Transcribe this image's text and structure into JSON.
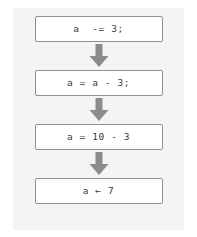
{
  "diagram": {
    "orientation": "vertical",
    "background_color": "#f4f4f4",
    "page_color": "#ffffff",
    "box_border_color": "#8e8e8e",
    "box_fill_color": "#ffffff",
    "text_color": "#3b3b3b",
    "arrow_color": "#8c8c8c",
    "steps": [
      {
        "label": "a  -= 3;",
        "name": "step-compound-assignment"
      },
      {
        "label": "a = a - 3;",
        "name": "step-expanded-assignment"
      },
      {
        "label": "a = 10 - 3",
        "name": "step-substituted-value"
      },
      {
        "label": "a ← 7",
        "name": "step-result-assignment"
      }
    ],
    "connectors": [
      {
        "icon": "down-arrow-icon",
        "from": 0,
        "to": 1
      },
      {
        "icon": "down-arrow-icon",
        "from": 1,
        "to": 2
      },
      {
        "icon": "down-arrow-icon",
        "from": 2,
        "to": 3
      }
    ]
  }
}
